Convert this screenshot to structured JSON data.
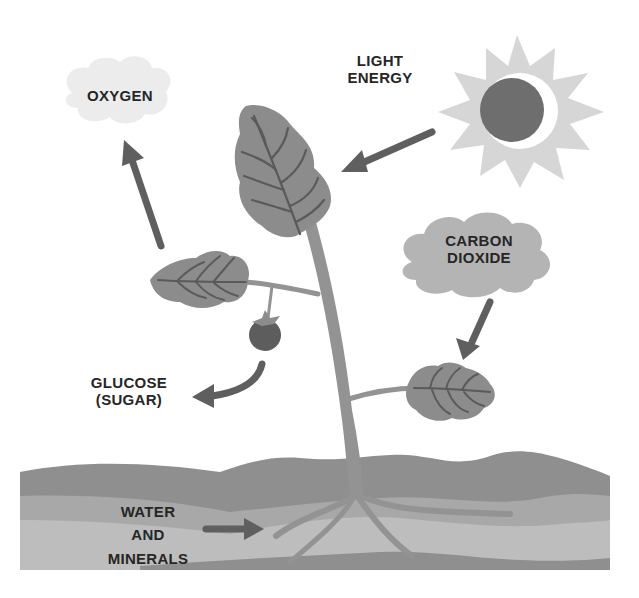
{
  "diagram": {
    "labels": {
      "oxygen": "OXYGEN",
      "light_energy_line1": "LIGHT",
      "light_energy_line2": "ENERGY",
      "carbon_dioxide_line1": "CARBON",
      "carbon_dioxide_line2": "DIOXIDE",
      "glucose_line1": "GLUCOSE",
      "glucose_line2": "(SUGAR)",
      "water_line1": "WATER",
      "water_line2": "AND",
      "water_line3": "MINERALS"
    },
    "colors": {
      "leaf": "#8c8c8c",
      "leaf_vein": "#5a5a5a",
      "stem": "#939393",
      "arrow": "#5f5f5f",
      "sun_rays": "#d6d6d6",
      "sun_core": "#6e6e6e",
      "oxygen_cloud": "#ececec",
      "co2_cloud": "#b4b4b4",
      "soil_top": "#8f8f8f",
      "soil_mid": "#a8a8a8",
      "soil_low": "#bdbdbd",
      "fruit": "#5d5d5d",
      "text": "#262626"
    }
  }
}
